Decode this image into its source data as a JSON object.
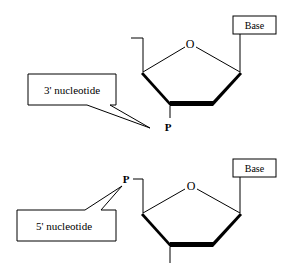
{
  "diagram": {
    "type": "chemical-structure",
    "top_nucleotide": {
      "ring_oxygen": "O",
      "base_label": "Base",
      "phosphate_label": "P",
      "callout": "3' nucleotide"
    },
    "bottom_nucleotide": {
      "ring_oxygen": "O",
      "base_label": "Base",
      "phosphate_label": "P",
      "callout": "5' nucleotide"
    }
  }
}
